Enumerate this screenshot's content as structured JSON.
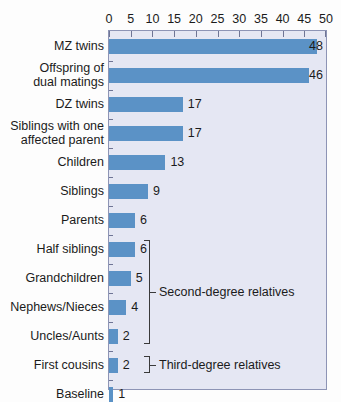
{
  "chart_data": {
    "type": "bar",
    "orientation": "horizontal",
    "title": "",
    "xlabel": "",
    "ylabel": "",
    "xlim": [
      0,
      50
    ],
    "xticks": [
      0,
      5,
      10,
      15,
      20,
      25,
      30,
      35,
      40,
      45,
      50
    ],
    "grid": false,
    "legend": null,
    "categories": [
      "MZ twins",
      "Offspring of dual matings",
      "DZ twins",
      "Siblings with one affected parent",
      "Children",
      "Siblings",
      "Parents",
      "Half siblings",
      "Grandchildren",
      "Nephews/Nieces",
      "Uncles/Aunts",
      "First cousins",
      "Baseline"
    ],
    "values": [
      48,
      46,
      17,
      17,
      13,
      9,
      6,
      6,
      5,
      4,
      2,
      2,
      1
    ],
    "annotations": [
      {
        "label": "Second-degree relatives",
        "covers": [
          "Half siblings",
          "Grandchildren",
          "Nephews/Nieces",
          "Uncles/Aunts"
        ]
      },
      {
        "label": "Third-degree relatives",
        "covers": [
          "First cousins"
        ]
      }
    ],
    "colors": {
      "bar": "#5b92c6",
      "plot_background": "#e5e7f3",
      "plot_border": "#8d94b5",
      "text": "#1b1b1b"
    }
  },
  "labels": {
    "categories_display": [
      [
        "MZ twins"
      ],
      [
        "Offspring of",
        "dual matings"
      ],
      [
        "DZ twins"
      ],
      [
        "Siblings with one",
        "affected parent"
      ],
      [
        "Children"
      ],
      [
        "Siblings"
      ],
      [
        "Parents"
      ],
      [
        "Half siblings"
      ],
      [
        "Grandchildren"
      ],
      [
        "Nephews/Nieces"
      ],
      [
        "Uncles/Aunts"
      ],
      [
        "First cousins"
      ],
      [
        "Baseline"
      ]
    ]
  }
}
